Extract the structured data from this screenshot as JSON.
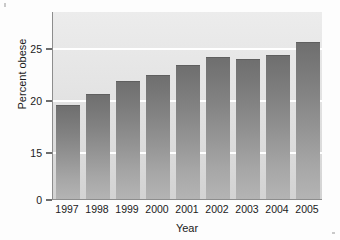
{
  "chart_data": {
    "type": "bar",
    "title": "",
    "subtitle": "",
    "xlabel": "Year",
    "ylabel": "Percent obese",
    "categories": [
      "1997",
      "1998",
      "1999",
      "2000",
      "2001",
      "2002",
      "2003",
      "2004",
      "2005"
    ],
    "values": [
      19.5,
      20.6,
      21.8,
      22.4,
      23.4,
      24.1,
      23.9,
      24.3,
      25.6
    ],
    "series": [
      {
        "name": "Percent obese",
        "values": [
          19.5,
          20.6,
          21.8,
          22.4,
          23.4,
          24.1,
          23.9,
          24.3,
          25.6
        ]
      }
    ],
    "ylim": [
      0,
      27.5
    ],
    "y_tick_labels": [
      "0",
      "15",
      "20",
      "25"
    ],
    "y_tick_values": [
      0,
      15,
      20,
      25
    ],
    "y_axis_broken": true,
    "x_tick_labels": [
      "1997",
      "1998",
      "1999",
      "2000",
      "2001",
      "2002",
      "2003",
      "2004",
      "2005"
    ],
    "grid": "horizontal-white",
    "legend": "none",
    "annotations": [],
    "colors": {
      "bar_top": "#6f6f6f",
      "bar_bottom": "#b4b4b4",
      "plot_background": "#e4e4e4",
      "gridline": "#ffffff",
      "axis": "#8d8d8d",
      "text": "#1b1b1b",
      "figure_background": "#fdfdfd"
    }
  }
}
